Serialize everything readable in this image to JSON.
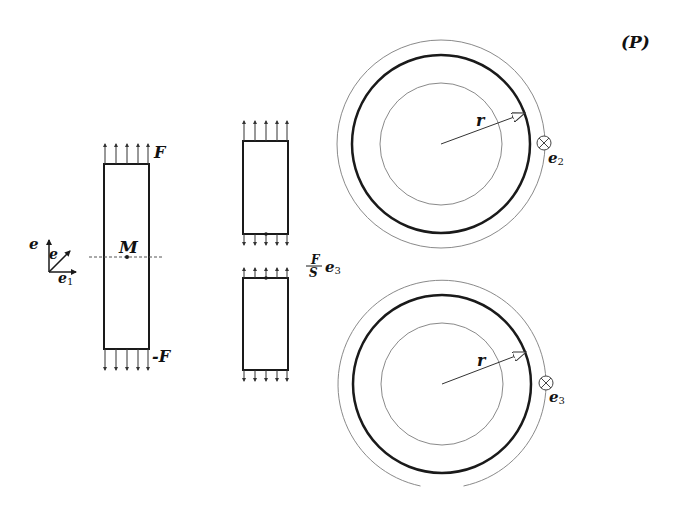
{
  "diagram": {
    "panel_label": "(P)",
    "left_bar": {
      "top_force_label": "F",
      "bottom_force_label": "-F",
      "point_label": "M"
    },
    "axes": {
      "e1_label": "e",
      "e1_sub": "1",
      "e2_label": "e",
      "e3_label": "e"
    },
    "cut_pieces": {
      "stress_fraction_num": "F",
      "stress_fraction_den": "S",
      "stress_vector": "e",
      "stress_vector_sub": "3"
    },
    "cross_section_top": {
      "radius_label": "r",
      "normal_label": "e",
      "normal_sub": "2"
    },
    "cross_section_bottom": {
      "radius_label": "r",
      "normal_label": "e",
      "normal_sub": "3"
    },
    "colors": {
      "stroke": "#1a1a1a",
      "thin_stroke": "#8a8a8a",
      "background": "#ffffff"
    }
  }
}
